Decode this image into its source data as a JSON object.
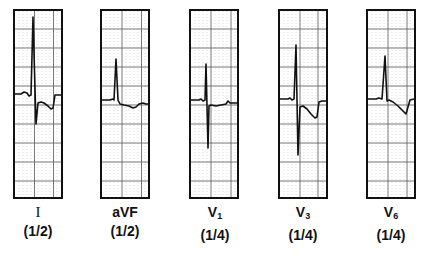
{
  "figure": {
    "leads": [
      {
        "id": "I",
        "label": "I",
        "subscript": "",
        "scale": "(1/2)"
      },
      {
        "id": "aVF",
        "label": "aVF",
        "subscript": "",
        "scale": "(1/2)"
      },
      {
        "id": "V1",
        "label": "V",
        "subscript": "1",
        "scale": "(1/4)"
      },
      {
        "id": "V3",
        "label": "V",
        "subscript": "3",
        "scale": "(1/4)"
      },
      {
        "id": "V6",
        "label": "V",
        "subscript": "6",
        "scale": "(1/4)"
      }
    ],
    "colors": {
      "trace": "#111111",
      "grid_major": "#555555",
      "grid_minor": "#bbbbbb",
      "border": "#111111",
      "background": "#ffffff"
    }
  }
}
